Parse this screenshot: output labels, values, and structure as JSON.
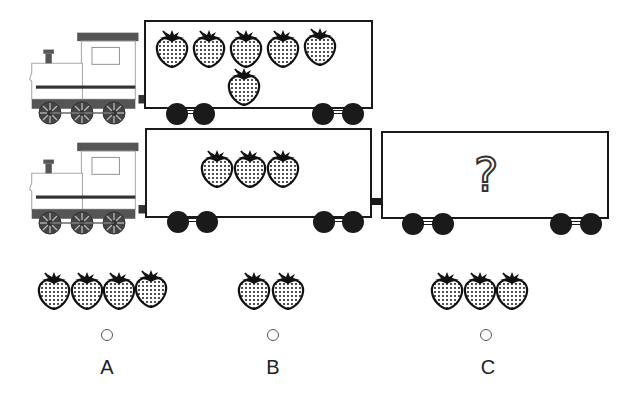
{
  "puzzle": {
    "rows": [
      {
        "engine": "locomotive",
        "wagons": [
          {
            "strawberries": 6,
            "unknown": false
          }
        ]
      },
      {
        "engine": "locomotive",
        "wagons": [
          {
            "strawberries": 3,
            "unknown": false
          },
          {
            "strawberries": null,
            "unknown": true,
            "symbol": "?"
          }
        ]
      }
    ],
    "options": [
      {
        "label": "A",
        "strawberries": 4
      },
      {
        "label": "B",
        "strawberries": 2
      },
      {
        "label": "C",
        "strawberries": 3
      }
    ]
  },
  "colors": {
    "outline": "#1a1a1a",
    "engine_gray": "#555555",
    "engine_body": "#ffffff"
  }
}
